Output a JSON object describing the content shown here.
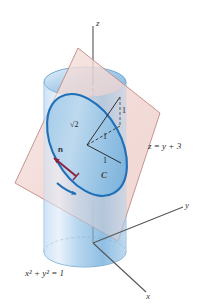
{
  "figure": {
    "background_color": "#ffffff"
  },
  "axes": {
    "z_label": "z",
    "y_label": "y",
    "x_label": "x",
    "axis_color": "#555555"
  },
  "surfaces": {
    "cylinder": {
      "name": "cylinder",
      "equation_label": "x² + y² = 1",
      "fill_light": "#dceaf8",
      "fill_mid": "#a9cde9",
      "fill_dark": "#7fb4dd",
      "edge_color": "#5f9fd0"
    },
    "plane": {
      "name": "plane",
      "equation_label": "z = y + 3",
      "fill": "#f2d9d6",
      "edge_color": "#c08a84"
    }
  },
  "curve": {
    "label": "C",
    "stroke_color": "#1f6fb8",
    "fill_color": "#8fc0e4"
  },
  "normal_vector": {
    "label": "n",
    "color": "#8d2340"
  },
  "dimensions": [
    {
      "label": "√2",
      "name": "sqrt2"
    },
    {
      "label": "1",
      "name": "one-vertical"
    },
    {
      "label": "1",
      "name": "one-diagonal"
    },
    {
      "label": "1",
      "name": "one-horizontal"
    }
  ],
  "dimension_values": {
    "sqrt2": "√2",
    "one_a": "1",
    "one_b": "1",
    "one_c": "1"
  }
}
